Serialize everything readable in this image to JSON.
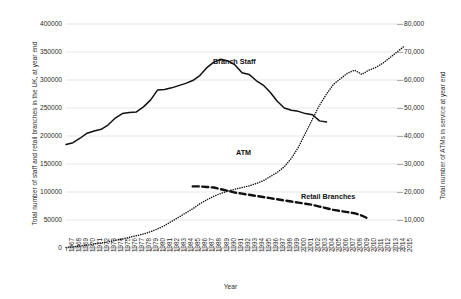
{
  "chart_data": {
    "type": "line",
    "title": "",
    "xlabel": "Year",
    "ylabel": "Total number of staff and retail branches in the UK, at year end",
    "ylabel_secondary": "Total number of ATMs in service at year end",
    "ylim": [
      0,
      400000
    ],
    "ylim_secondary": [
      0,
      80000
    ],
    "grid": true,
    "legend": "inline-annotations",
    "y_ticks_left": [
      "0",
      "50000",
      "100000",
      "150000",
      "200000",
      "250000",
      "300000",
      "350000",
      "400000"
    ],
    "y_ticks_right": [
      "-",
      "10,000",
      "20,000",
      "30,000",
      "40,000",
      "50,000",
      "60,000",
      "70,000",
      "80,000"
    ],
    "x": [
      1967,
      1968,
      1969,
      1970,
      1971,
      1972,
      1973,
      1974,
      1975,
      1976,
      1977,
      1978,
      1979,
      1980,
      1981,
      1982,
      1983,
      1984,
      1985,
      1986,
      1987,
      1988,
      1989,
      1990,
      1991,
      1992,
      1993,
      1994,
      1995,
      1996,
      1997,
      1998,
      1999,
      2000,
      2001,
      2002,
      2003,
      2004,
      2005,
      2006,
      2007,
      2008,
      2009,
      2010,
      2011,
      2012,
      2013,
      2014,
      2015
    ],
    "series": [
      {
        "name": "Branch Staff",
        "axis": "left",
        "style": "solid",
        "values": [
          185000,
          188000,
          196000,
          205000,
          209000,
          212000,
          220000,
          232000,
          240000,
          242000,
          243000,
          252000,
          264000,
          282000,
          283000,
          286000,
          290000,
          294000,
          299000,
          308000,
          322000,
          332000,
          337000,
          334000,
          327000,
          313000,
          310000,
          299000,
          291000,
          278000,
          262000,
          250000,
          246000,
          244000,
          240000,
          238000,
          227000,
          225000,
          null,
          null,
          null,
          null,
          null,
          null,
          null,
          null,
          null,
          null,
          null
        ]
      },
      {
        "name": "ATM",
        "axis": "right",
        "style": "dotted",
        "values": [
          200,
          400,
          700,
          1000,
          1400,
          1800,
          2200,
          2700,
          3200,
          3800,
          4400,
          5000,
          5800,
          6800,
          8000,
          9500,
          11000,
          12500,
          14000,
          15800,
          17200,
          18500,
          19500,
          20300,
          21000,
          21600,
          22200,
          23000,
          24000,
          25500,
          27000,
          29000,
          32000,
          36000,
          41000,
          46000,
          51000,
          55000,
          58500,
          60500,
          62500,
          63500,
          62000,
          63500,
          64500,
          66000,
          68000,
          70000,
          72000
        ]
      },
      {
        "name": "Retail Branches",
        "axis": "left",
        "style": "dashed",
        "values": [
          null,
          null,
          null,
          null,
          null,
          null,
          null,
          null,
          null,
          null,
          null,
          null,
          null,
          null,
          null,
          null,
          null,
          null,
          110000,
          110000,
          109000,
          108000,
          105000,
          102000,
          99000,
          97000,
          95000,
          93000,
          91000,
          89000,
          87000,
          85000,
          83000,
          81000,
          79000,
          77000,
          74000,
          71000,
          68000,
          66000,
          64000,
          62000,
          58000,
          52000,
          null,
          null,
          null,
          null,
          null
        ]
      }
    ],
    "annotations": [
      {
        "text": "Branch Staff"
      },
      {
        "text": "ATM"
      },
      {
        "text": "Retail Branches"
      }
    ]
  },
  "caption": ""
}
